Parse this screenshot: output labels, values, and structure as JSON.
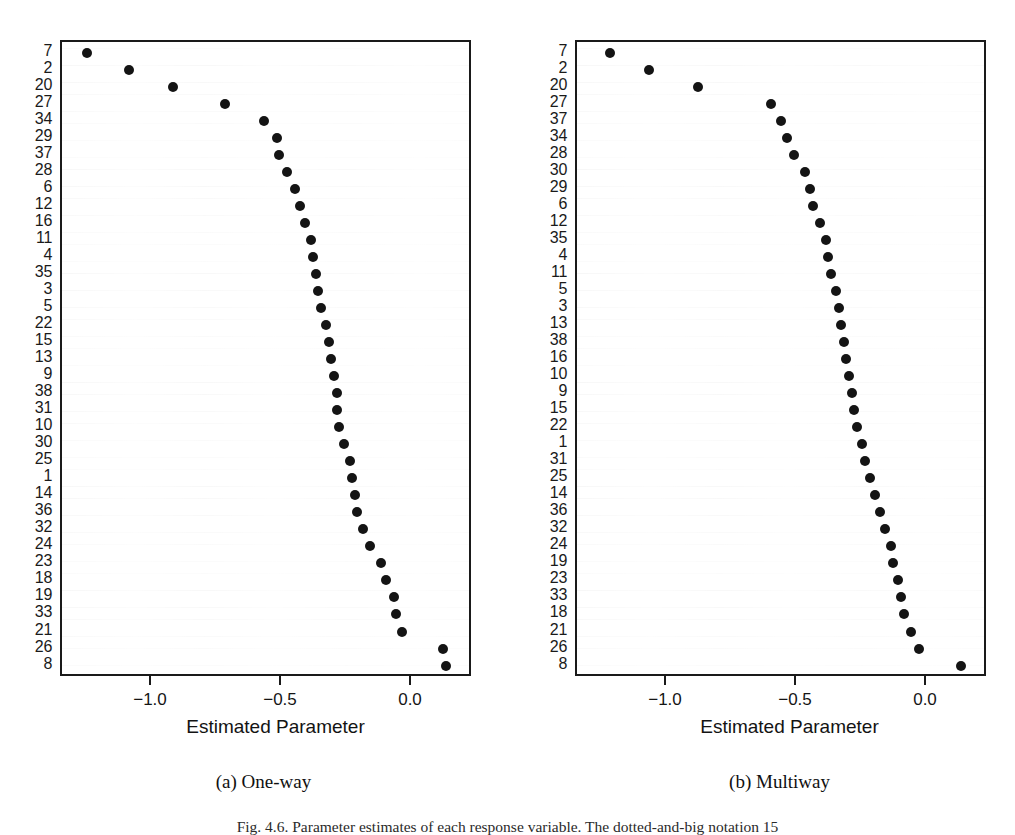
{
  "figure": {
    "caption": "Fig. 4.6. Parameter estimates of each response variable. The dotted-and-big notation 15"
  },
  "chart_data": [
    {
      "type": "scatter",
      "panel_id": "a",
      "subcaption": "(a) One-way",
      "title": "",
      "xlabel": "Estimated Parameter",
      "ylabel": "",
      "xlim": [
        -1.35,
        0.21
      ],
      "xticks": [
        -1.0,
        -0.5,
        0.0
      ],
      "xticklabels": [
        "−1.0",
        "−0.5",
        "0.0"
      ],
      "grid": false,
      "categories": [
        "7",
        "2",
        "20",
        "27",
        "34",
        "29",
        "37",
        "28",
        "6",
        "12",
        "16",
        "11",
        "4",
        "35",
        "3",
        "5",
        "22",
        "15",
        "13",
        "9",
        "38",
        "31",
        "10",
        "30",
        "25",
        "1",
        "14",
        "36",
        "32",
        "24",
        "23",
        "18",
        "19",
        "33",
        "21",
        "26",
        "8"
      ],
      "values": [
        -1.25,
        -1.09,
        -0.92,
        -0.72,
        -0.57,
        -0.52,
        -0.51,
        -0.48,
        -0.45,
        -0.43,
        -0.41,
        -0.39,
        -0.38,
        -0.37,
        -0.36,
        -0.35,
        -0.33,
        -0.32,
        -0.31,
        -0.3,
        -0.29,
        -0.29,
        -0.28,
        -0.26,
        -0.24,
        -0.23,
        -0.22,
        -0.21,
        -0.19,
        -0.16,
        -0.12,
        -0.1,
        -0.07,
        -0.06,
        -0.04,
        0.12,
        0.13
      ]
    },
    {
      "type": "scatter",
      "panel_id": "b",
      "subcaption": "(b) Multiway",
      "title": "",
      "xlabel": "Estimated Parameter",
      "ylabel": "",
      "xlim": [
        -1.35,
        0.21
      ],
      "xticks": [
        -1.0,
        -0.5,
        0.0
      ],
      "xticklabels": [
        "−1.0",
        "−0.5",
        "0.0"
      ],
      "grid": false,
      "categories": [
        "7",
        "2",
        "20",
        "27",
        "37",
        "34",
        "28",
        "30",
        "29",
        "6",
        "12",
        "35",
        "4",
        "11",
        "5",
        "3",
        "13",
        "38",
        "16",
        "10",
        "9",
        "15",
        "22",
        "1",
        "31",
        "25",
        "14",
        "36",
        "32",
        "24",
        "19",
        "23",
        "33",
        "18",
        "21",
        "26",
        "8"
      ],
      "values": [
        -1.22,
        -1.07,
        -0.88,
        -0.6,
        -0.56,
        -0.54,
        -0.51,
        -0.47,
        -0.45,
        -0.44,
        -0.41,
        -0.39,
        -0.38,
        -0.37,
        -0.35,
        -0.34,
        -0.33,
        -0.32,
        -0.31,
        -0.3,
        -0.29,
        -0.28,
        -0.27,
        -0.25,
        -0.24,
        -0.22,
        -0.2,
        -0.18,
        -0.16,
        -0.14,
        -0.13,
        -0.11,
        -0.1,
        -0.09,
        -0.06,
        -0.03,
        0.13
      ]
    }
  ]
}
